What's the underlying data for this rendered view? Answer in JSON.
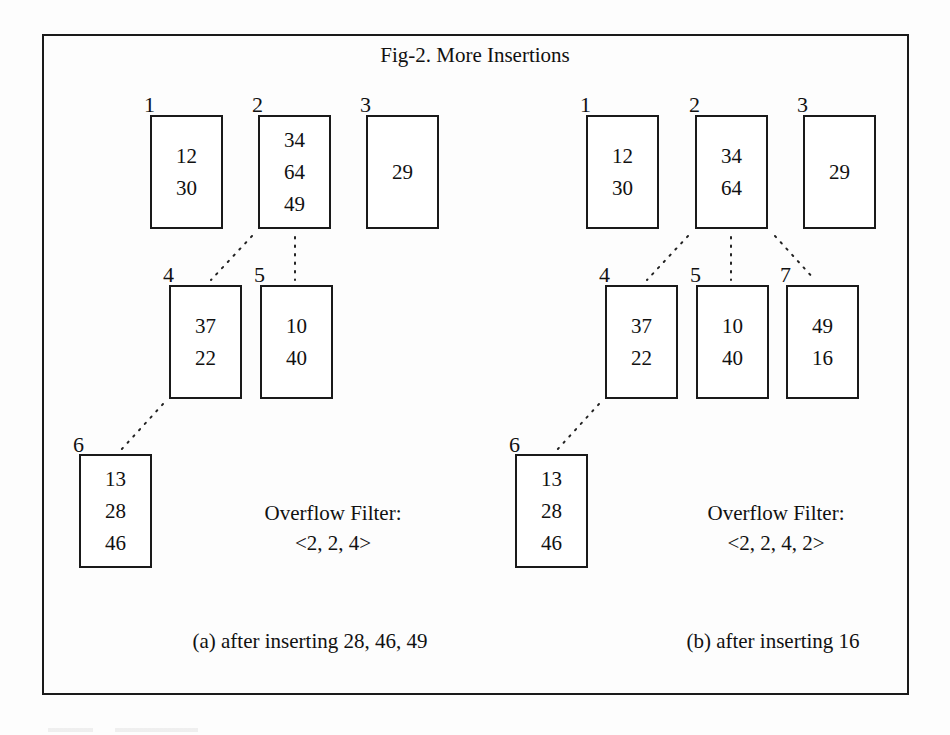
{
  "title": "Fig-2. More Insertions",
  "panels": {
    "a": {
      "caption": "(a) after inserting 28, 46, 49",
      "filter_label": "Overflow Filter:",
      "filter_value": "<2, 2, 4>",
      "pages": [
        {
          "id": "1",
          "values": [
            "12",
            "30"
          ]
        },
        {
          "id": "2",
          "values": [
            "34",
            "64",
            "49"
          ]
        },
        {
          "id": "3",
          "values": [
            "29"
          ]
        },
        {
          "id": "4",
          "values": [
            "37",
            "22"
          ]
        },
        {
          "id": "5",
          "values": [
            "10",
            "40"
          ]
        },
        {
          "id": "6",
          "values": [
            "13",
            "28",
            "46"
          ]
        }
      ],
      "links": [
        [
          "2",
          "4"
        ],
        [
          "2",
          "5"
        ],
        [
          "4",
          "6"
        ]
      ]
    },
    "b": {
      "caption": "(b) after inserting 16",
      "filter_label": "Overflow Filter:",
      "filter_value": "<2, 2, 4, 2>",
      "pages": [
        {
          "id": "1",
          "values": [
            "12",
            "30"
          ]
        },
        {
          "id": "2",
          "values": [
            "34",
            "64"
          ]
        },
        {
          "id": "3",
          "values": [
            "29"
          ]
        },
        {
          "id": "4",
          "values": [
            "37",
            "22"
          ]
        },
        {
          "id": "5",
          "values": [
            "10",
            "40"
          ]
        },
        {
          "id": "7",
          "values": [
            "49",
            "16"
          ]
        },
        {
          "id": "6",
          "values": [
            "13",
            "28",
            "46"
          ]
        }
      ],
      "links": [
        [
          "2",
          "4"
        ],
        [
          "2",
          "5"
        ],
        [
          "2",
          "7"
        ],
        [
          "4",
          "6"
        ]
      ]
    }
  }
}
